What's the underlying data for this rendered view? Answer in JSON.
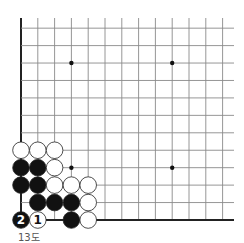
{
  "diagram": {
    "caption": "13도",
    "board": {
      "columns": 13,
      "rows": 12,
      "origin_x": 21,
      "origin_y_bottom": 220,
      "spacing_x": 16.8,
      "spacing_y": 17.44,
      "edges": [
        "left",
        "bottom"
      ],
      "star_points": [
        [
          3,
          9
        ],
        [
          9,
          9
        ],
        [
          3,
          3
        ],
        [
          9,
          3
        ]
      ],
      "line_color": "#8a8a8a",
      "edge_color": "#222222"
    },
    "stones": [
      {
        "col": 0,
        "row": 4,
        "color": "white"
      },
      {
        "col": 1,
        "row": 4,
        "color": "white"
      },
      {
        "col": 2,
        "row": 4,
        "color": "white"
      },
      {
        "col": 0,
        "row": 3,
        "color": "black"
      },
      {
        "col": 1,
        "row": 3,
        "color": "black"
      },
      {
        "col": 2,
        "row": 3,
        "color": "white"
      },
      {
        "col": 0,
        "row": 2,
        "color": "black"
      },
      {
        "col": 1,
        "row": 2,
        "color": "black"
      },
      {
        "col": 2,
        "row": 2,
        "color": "white"
      },
      {
        "col": 3,
        "row": 2,
        "color": "white"
      },
      {
        "col": 4,
        "row": 2,
        "color": "white"
      },
      {
        "col": 1,
        "row": 1,
        "color": "black"
      },
      {
        "col": 2,
        "row": 1,
        "color": "black"
      },
      {
        "col": 3,
        "row": 1,
        "color": "black"
      },
      {
        "col": 4,
        "row": 1,
        "color": "white"
      },
      {
        "col": 0,
        "row": 0,
        "color": "black",
        "label": "2"
      },
      {
        "col": 1,
        "row": 0,
        "color": "white",
        "label": "1"
      },
      {
        "col": 3,
        "row": 0,
        "color": "black"
      },
      {
        "col": 4,
        "row": 0,
        "color": "white"
      }
    ]
  }
}
